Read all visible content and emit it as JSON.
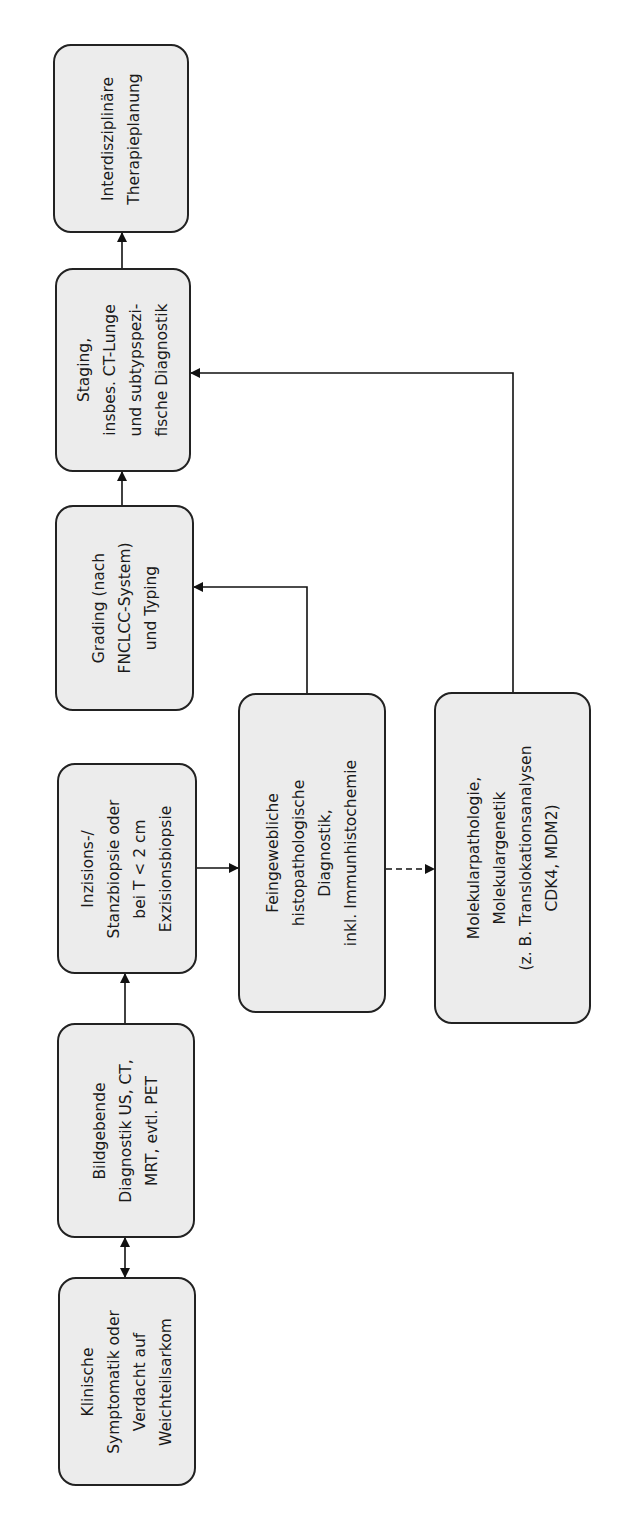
{
  "diagram": {
    "type": "flowchart",
    "orientation": "rotated-90-ccw",
    "nodes": [
      {
        "id": "therapie",
        "lines": [
          "Interdisziplinäre",
          "Therapieplanung"
        ]
      },
      {
        "id": "staging",
        "lines": [
          "Staging,",
          "insbes. CT-Lunge",
          "und subtypspezi-",
          "fische Diagnostik"
        ]
      },
      {
        "id": "grading",
        "lines": [
          "Grading (nach",
          "FNCLCC-System)",
          "und Typing"
        ]
      },
      {
        "id": "biopsie",
        "lines": [
          "Inzisions-/",
          "Stanzbiopsie oder",
          "bei T < 2 cm",
          "Exzisionsbiopsie"
        ]
      },
      {
        "id": "bildgebung",
        "lines": [
          "Bildgebende",
          "Diagnostik US, CT,",
          "MRT, evtl. PET"
        ]
      },
      {
        "id": "klinik",
        "lines": [
          "Klinische",
          "Symptomatik oder",
          "Verdacht auf",
          "Weichteilsarkom"
        ]
      },
      {
        "id": "histo",
        "lines": [
          "Feingewebliche",
          "histopathologische",
          "Diagnostik,",
          "inkl. Immunhistochemie"
        ]
      },
      {
        "id": "molekular",
        "lines": [
          "Molekularpathologie,",
          "Molekulargenetik",
          "(z. B. Translokationsanalysen",
          "CDK4, MDM2)"
        ]
      }
    ],
    "edges": [
      {
        "from": "klinik",
        "to": "bildgebung",
        "style": "solid",
        "bidirectional": true
      },
      {
        "from": "bildgebung",
        "to": "biopsie",
        "style": "solid"
      },
      {
        "from": "biopsie",
        "to": "histo",
        "style": "solid"
      },
      {
        "from": "histo",
        "to": "grading",
        "style": "solid"
      },
      {
        "from": "histo",
        "to": "molekular",
        "style": "dashed"
      },
      {
        "from": "grading",
        "to": "staging",
        "style": "solid"
      },
      {
        "from": "molekular",
        "to": "staging",
        "style": "solid"
      },
      {
        "from": "staging",
        "to": "therapie",
        "style": "solid"
      }
    ],
    "colors": {
      "box_fill": "#ececec",
      "stroke": "#222222",
      "text": "#1a1a1a",
      "background": "#ffffff"
    }
  }
}
